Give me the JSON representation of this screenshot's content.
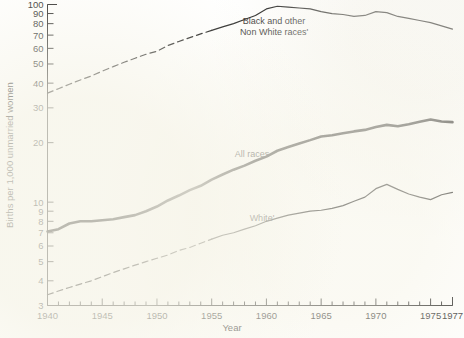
{
  "chart_data": {
    "type": "line",
    "title": "",
    "xlabel": "Year",
    "ylabel": "Births per 1,000 unmarried women",
    "yscale": "log",
    "ylim": [
      3,
      100
    ],
    "xlim": [
      1940,
      1977
    ],
    "grid": false,
    "legend_position": "inline-annotations",
    "y_ticks": [
      3,
      4,
      5,
      6,
      7,
      8,
      9,
      10,
      20,
      30,
      40,
      50,
      60,
      70,
      80,
      90,
      100
    ],
    "y_tick_labels": [
      "3",
      "4",
      "5",
      "6",
      "7",
      "8",
      "9",
      "10",
      "20",
      "30",
      "40",
      "50",
      "60",
      "70",
      "80",
      "90",
      "100"
    ],
    "x_ticks": [
      1940,
      1941,
      1942,
      1943,
      1944,
      1945,
      1946,
      1947,
      1948,
      1949,
      1950,
      1951,
      1952,
      1953,
      1954,
      1955,
      1956,
      1957,
      1958,
      1959,
      1960,
      1961,
      1962,
      1963,
      1964,
      1965,
      1966,
      1967,
      1968,
      1969,
      1970,
      1971,
      1972,
      1973,
      1974,
      1975,
      1976,
      1977
    ],
    "x_tick_labels": [
      "1940",
      "1945",
      "1950",
      "1955",
      "1960",
      "1965",
      "1970",
      "1975",
      "1977"
    ],
    "x_labeled_ticks": [
      1940,
      1945,
      1950,
      1955,
      1960,
      1965,
      1970,
      1975,
      1977
    ],
    "series": [
      {
        "name": "Black and other Non White races'",
        "label": "Black and other",
        "label_line2": "Non White races'",
        "style": "dashed-then-solid",
        "dashed_until": 1955,
        "x": [
          1940,
          1941,
          1942,
          1943,
          1944,
          1945,
          1946,
          1947,
          1948,
          1949,
          1950,
          1951,
          1952,
          1953,
          1954,
          1955,
          1956,
          1957,
          1958,
          1959,
          1960,
          1961,
          1962,
          1963,
          1964,
          1965,
          1966,
          1967,
          1968,
          1969,
          1970,
          1971,
          1972,
          1973,
          1974,
          1975,
          1976,
          1977
        ],
        "values": [
          35.6,
          37.5,
          39.5,
          41.5,
          43.5,
          46,
          48.5,
          51,
          53.5,
          56,
          58,
          62,
          65,
          68,
          71,
          74,
          77,
          80,
          84,
          88,
          95,
          98,
          97,
          96,
          95,
          92,
          90,
          89,
          87,
          88,
          92,
          91,
          87,
          85,
          83,
          81,
          78,
          75
        ]
      },
      {
        "name": "All races",
        "label": "All races",
        "style": "solid-thick",
        "x": [
          1940,
          1941,
          1942,
          1943,
          1944,
          1945,
          1946,
          1947,
          1948,
          1949,
          1950,
          1951,
          1952,
          1953,
          1954,
          1955,
          1956,
          1957,
          1958,
          1959,
          1960,
          1961,
          1962,
          1963,
          1964,
          1965,
          1966,
          1967,
          1968,
          1969,
          1970,
          1971,
          1972,
          1973,
          1974,
          1975,
          1976,
          1977
        ],
        "values": [
          7.1,
          7.3,
          7.8,
          8.0,
          8.0,
          8.1,
          8.2,
          8.4,
          8.6,
          9.0,
          9.5,
          10.2,
          10.8,
          11.5,
          12.1,
          13.0,
          13.8,
          14.6,
          15.3,
          16.2,
          17.0,
          18.2,
          19.0,
          19.8,
          20.6,
          21.5,
          21.8,
          22.3,
          22.8,
          23.2,
          24.0,
          24.6,
          24.2,
          24.8,
          25.5,
          26.2,
          25.6,
          25.4
        ]
      },
      {
        "name": "White'",
        "label": "White'",
        "style": "dashed-then-solid",
        "dashed_until": 1955,
        "x": [
          1940,
          1941,
          1942,
          1943,
          1944,
          1945,
          1946,
          1947,
          1948,
          1949,
          1950,
          1951,
          1952,
          1953,
          1954,
          1955,
          1956,
          1957,
          1958,
          1959,
          1960,
          1961,
          1962,
          1963,
          1964,
          1965,
          1966,
          1967,
          1968,
          1969,
          1970,
          1971,
          1972,
          1973,
          1974,
          1975,
          1976,
          1977
        ],
        "values": [
          3.4,
          3.55,
          3.7,
          3.85,
          4.0,
          4.2,
          4.4,
          4.6,
          4.8,
          5.0,
          5.2,
          5.4,
          5.7,
          5.9,
          6.2,
          6.5,
          6.8,
          7.0,
          7.3,
          7.6,
          8.0,
          8.3,
          8.6,
          8.8,
          9.0,
          9.1,
          9.3,
          9.6,
          10.1,
          10.6,
          11.7,
          12.3,
          11.6,
          11.0,
          10.6,
          10.3,
          10.9,
          11.2
        ]
      }
    ]
  },
  "axes": {
    "y_title": "Births per 1,000 unmarried women",
    "x_title": "Year"
  },
  "annotations": {
    "top_series_line1": "Black and other",
    "top_series_line2": "Non White races'",
    "mid_series": "All races",
    "bottom_series": "White'"
  }
}
